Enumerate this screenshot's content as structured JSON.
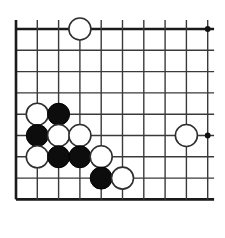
{
  "figure": {
    "kind": "go-board-diagram",
    "board": {
      "columns": 10,
      "rows": 9,
      "visible_edges": [
        "left",
        "top",
        "bottom"
      ],
      "open_edge": "right",
      "line_color": "#3a3a3a",
      "edge_color": "#1a1a1a",
      "background_color": "#ffffff",
      "origin_x": 16,
      "origin_y": 29,
      "spacing_x": 21.3,
      "spacing_y": 21.3
    },
    "star_points": [
      {
        "col": 10,
        "row": 1
      },
      {
        "col": 10,
        "row": 6
      }
    ],
    "stone_radius": 11,
    "stones": [
      {
        "id": "w-c4-r1",
        "color": "white",
        "col": 4,
        "row": 1
      },
      {
        "id": "w-c2-r5",
        "color": "white",
        "col": 2,
        "row": 5
      },
      {
        "id": "b-c3-r5",
        "color": "black",
        "col": 3,
        "row": 5
      },
      {
        "id": "b-c2-r6",
        "color": "black",
        "col": 2,
        "row": 6
      },
      {
        "id": "w-c3-r6",
        "color": "white",
        "col": 3,
        "row": 6
      },
      {
        "id": "w-c4-r6",
        "color": "white",
        "col": 4,
        "row": 6
      },
      {
        "id": "w-c9-r6",
        "color": "white",
        "col": 9,
        "row": 6
      },
      {
        "id": "w-c2-r7",
        "color": "white",
        "col": 2,
        "row": 7
      },
      {
        "id": "b-c3-r7",
        "color": "black",
        "col": 3,
        "row": 7
      },
      {
        "id": "b-c4-r7",
        "color": "black",
        "col": 4,
        "row": 7
      },
      {
        "id": "w-c5-r7",
        "color": "white",
        "col": 5,
        "row": 7
      },
      {
        "id": "b-c5-r8",
        "color": "black",
        "col": 5,
        "row": 8
      },
      {
        "id": "w-c6-r8",
        "color": "white",
        "col": 6,
        "row": 8
      }
    ],
    "counts": {
      "black_stones": 5,
      "white_stones": 8,
      "total_stones": 13
    },
    "colors": {
      "black_stone": "#0d0d0d",
      "white_stone_fill": "#ffffff",
      "white_stone_stroke": "#2e2e2e",
      "star_point": "#111111"
    }
  }
}
